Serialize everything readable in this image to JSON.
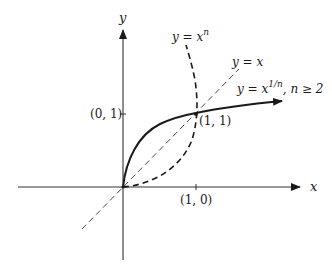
{
  "figure": {
    "type": "function-graph-diagram",
    "axes": {
      "x_label": "x",
      "y_label": "y"
    },
    "points": {
      "y_tick_label": "(0, 1)",
      "x_tick_label": "(1, 0)",
      "intersection_label": "(1, 1)"
    },
    "curves": {
      "power": {
        "lhs": "y = x",
        "exponent": "n",
        "style": "dashed"
      },
      "identity": {
        "label": "y = x",
        "style": "dashed-thin"
      },
      "root": {
        "lhs": "y = x",
        "exponent": "1/n",
        "condition": ", n ≥ 2",
        "style": "solid-bold-arrow"
      }
    },
    "colors": {
      "ink": "#1a1a1a",
      "background": "#ffffff"
    }
  }
}
